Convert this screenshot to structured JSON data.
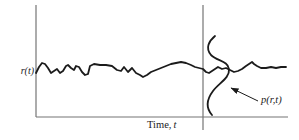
{
  "figure": {
    "labels": {
      "y_axis": "r(t)",
      "x_axis_name": "Time,",
      "x_axis_symbol": "t",
      "pdf": "p(r,t)"
    },
    "colors": {
      "axis": "#757575",
      "ink": "#1b1b1b",
      "background": "#ffffff"
    },
    "geometry": {
      "axes": {
        "y_axis": {
          "x": 36,
          "y1": 5,
          "y2": 117
        },
        "x_axis": {
          "y": 117,
          "x1": 36,
          "x2": 288
        },
        "t_line": {
          "x": 203,
          "y1": 5,
          "y2": 130
        }
      },
      "signal_points": [
        [
          36,
          73
        ],
        [
          39,
          67
        ],
        [
          42,
          63
        ],
        [
          45,
          64
        ],
        [
          48,
          68
        ],
        [
          51,
          73
        ],
        [
          54,
          71
        ],
        [
          57,
          69
        ],
        [
          60,
          73
        ],
        [
          63,
          71
        ],
        [
          66,
          66
        ],
        [
          68,
          65
        ],
        [
          71,
          68
        ],
        [
          74,
          70
        ],
        [
          76,
          66
        ],
        [
          79,
          67
        ],
        [
          82,
          72
        ],
        [
          85,
          75
        ],
        [
          88,
          74
        ],
        [
          90,
          66
        ],
        [
          94,
          64
        ],
        [
          100,
          65
        ],
        [
          106,
          65
        ],
        [
          112,
          66
        ],
        [
          117,
          70
        ],
        [
          121,
          71
        ],
        [
          124,
          67
        ],
        [
          128,
          72
        ],
        [
          132,
          68
        ],
        [
          136,
          73
        ],
        [
          140,
          75
        ],
        [
          143,
          77
        ],
        [
          147,
          75
        ],
        [
          151,
          72
        ],
        [
          156,
          70
        ],
        [
          161,
          68
        ],
        [
          166,
          66
        ],
        [
          171,
          64
        ],
        [
          176,
          63
        ],
        [
          181,
          62
        ],
        [
          186,
          63
        ],
        [
          191,
          65
        ],
        [
          195,
          67
        ],
        [
          199,
          68
        ],
        [
          203,
          69
        ],
        [
          206,
          72
        ],
        [
          209,
          73
        ],
        [
          212,
          71
        ],
        [
          215,
          69
        ],
        [
          218,
          67
        ],
        [
          222,
          69
        ],
        [
          226,
          68
        ],
        [
          230,
          70
        ],
        [
          234,
          72
        ],
        [
          238,
          71
        ],
        [
          242,
          69
        ],
        [
          246,
          66
        ],
        [
          249,
          64
        ],
        [
          252,
          62
        ],
        [
          254,
          64
        ],
        [
          257,
          66
        ],
        [
          261,
          68
        ],
        [
          266,
          68
        ],
        [
          271,
          67
        ],
        [
          276,
          68
        ],
        [
          281,
          67
        ],
        [
          286,
          67
        ]
      ],
      "pdf_path": "M215,36 C209,41 205,48 211,55 C217,61 228,61 229,69 C230,78 219,83 213,91 C207,99 205,107 212,115",
      "arrow": {
        "from": [
          258,
          101
        ],
        "to": [
          231,
          88
        ]
      }
    }
  }
}
